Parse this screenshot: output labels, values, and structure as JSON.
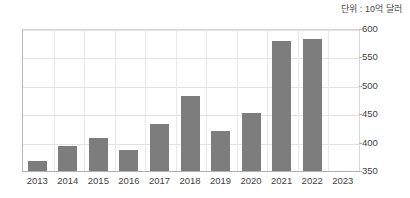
{
  "chart_data": {
    "type": "bar",
    "title": "",
    "subtitle": "",
    "unit_note": "단위 : 10억 달러",
    "xlabel": "",
    "ylabel": "",
    "categories": [
      "2013",
      "2014",
      "2015",
      "2016",
      "2017",
      "2018",
      "2019",
      "2020",
      "2021",
      "2022",
      "2023"
    ],
    "values": [
      367,
      394,
      408,
      387,
      433,
      482,
      420,
      452,
      578,
      582,
      null
    ],
    "ylim": [
      350,
      600
    ],
    "yticks": [
      350,
      400,
      450,
      500,
      550,
      600
    ],
    "ytick_labels": [
      "350",
      "400",
      "450",
      "500",
      "550",
      "600"
    ],
    "grid": true,
    "legend": false,
    "series": [
      {
        "name": "",
        "color": "#7d7d7d",
        "values": [
          367,
          394,
          408,
          387,
          433,
          482,
          420,
          452,
          578,
          582,
          null
        ]
      }
    ]
  },
  "colors": {
    "bar": "#7d7d7d",
    "grid": "#e2e2e2",
    "axis": "#b0b0b0",
    "text": "#3f3f3f",
    "background": "#ffffff"
  }
}
